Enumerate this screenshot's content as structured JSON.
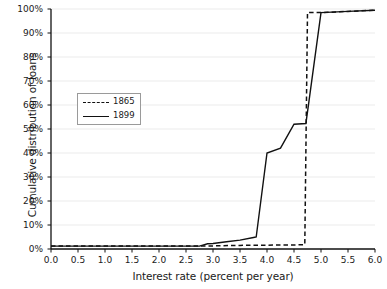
{
  "chart_data": {
    "type": "line",
    "title": "",
    "subtitle": "",
    "xlabel": "Interest rate (percent per year)",
    "ylabel": "Cumulative distribution of loans",
    "xlim": [
      0.0,
      6.0
    ],
    "ylim": [
      0,
      100
    ],
    "xtick_step": 0.5,
    "ytick_step": 10,
    "grid": true,
    "grid_axis": "y",
    "grid_color": "#ebebeb",
    "legend_position": "upper left inside",
    "axis_color": "#111111",
    "xticks": [
      "0.0",
      "0.5",
      "1.0",
      "1.5",
      "2.0",
      "2.5",
      "3.0",
      "3.5",
      "4.0",
      "4.5",
      "5.0",
      "5.5",
      "6.0"
    ],
    "xtick_values": [
      0.0,
      0.5,
      1.0,
      1.5,
      2.0,
      2.5,
      3.0,
      3.5,
      4.0,
      4.5,
      5.0,
      5.5,
      6.0
    ],
    "yticks": [
      "0%",
      "10%",
      "20%",
      "30%",
      "40%",
      "50%",
      "60%",
      "70%",
      "80%",
      "90%",
      "100%"
    ],
    "ytick_values": [
      0,
      10,
      20,
      30,
      40,
      50,
      60,
      70,
      80,
      90,
      100
    ],
    "series": [
      {
        "name": "1865",
        "style": "dashed",
        "color": "#111111",
        "x": [
          0.0,
          0.5,
          1.0,
          1.5,
          2.0,
          2.5,
          2.8,
          3.0,
          3.5,
          4.0,
          4.5,
          4.7,
          4.75,
          5.0,
          5.5,
          6.0
        ],
        "values": [
          1.2,
          1.2,
          1.2,
          1.2,
          1.2,
          1.2,
          1.2,
          1.3,
          1.5,
          1.6,
          1.7,
          1.8,
          98.5,
          98.5,
          99.0,
          99.5
        ]
      },
      {
        "name": "1899",
        "style": "solid",
        "color": "#111111",
        "x": [
          0.0,
          0.5,
          1.0,
          1.5,
          2.0,
          2.5,
          2.75,
          2.9,
          3.0,
          3.25,
          3.5,
          3.75,
          3.8,
          4.0,
          4.25,
          4.5,
          4.72,
          4.78,
          5.0,
          5.5,
          6.0
        ],
        "values": [
          1.2,
          1.2,
          1.2,
          1.2,
          1.2,
          1.2,
          1.2,
          2.2,
          2.3,
          3.0,
          3.7,
          4.8,
          5.0,
          40.0,
          42.0,
          52.0,
          52.3,
          62.0,
          98.5,
          99.0,
          99.5
        ]
      }
    ]
  },
  "legend": {
    "entries": [
      {
        "label": "1865",
        "style": "dashed"
      },
      {
        "label": "1899",
        "style": "solid"
      }
    ]
  }
}
